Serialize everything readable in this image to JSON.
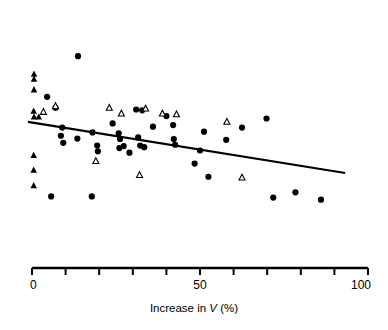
{
  "figure": {
    "title": "",
    "axis_label": "Increase in V (%)",
    "axis_label_parts": {
      "prefix": "Increase in ",
      "variable": "V",
      "suffix": " (%)"
    }
  },
  "chart_data": {
    "type": "scatter",
    "title": "",
    "xlabel": "Increase in V (%)",
    "ylabel": "",
    "xlim": [
      0,
      100
    ],
    "ylim": [
      0,
      100
    ],
    "grid": false,
    "legend": "none",
    "x_ticks": [
      0,
      10,
      20,
      30,
      40,
      50,
      60,
      70,
      80,
      90,
      100
    ],
    "x_tick_labels": [
      "0",
      "",
      "",
      "",
      "",
      "50",
      "",
      "",
      "",
      "",
      "100"
    ],
    "x_axis_labeled_ticks": [
      "0",
      "50",
      "100"
    ],
    "y_axis_visible": false,
    "regression_line": {
      "label": "fitted regression line",
      "x_start": -1.2,
      "x_end": 93.2,
      "y_start": 55.0,
      "y_end": 23.8,
      "color": "#000000",
      "width": 2.2
    },
    "series": [
      {
        "name": "filled-circle",
        "marker": "circle-filled",
        "color": "#000000",
        "size": 6.2,
        "points": [
          [
            13.7,
            95.0
          ],
          [
            4.5,
            70.2
          ],
          [
            7.0,
            63.5
          ],
          [
            9.0,
            51.5
          ],
          [
            8.6,
            46.5
          ],
          [
            9.3,
            42.2
          ],
          [
            5.7,
            9.5
          ],
          [
            13.5,
            44.8
          ],
          [
            18.0,
            48.5
          ],
          [
            17.8,
            9.5
          ],
          [
            19.4,
            40.5
          ],
          [
            19.6,
            37.0
          ],
          [
            24.0,
            54.0
          ],
          [
            25.8,
            48.0
          ],
          [
            26.2,
            44.5
          ],
          [
            26.0,
            39.0
          ],
          [
            27.3,
            40.2
          ],
          [
            29.0,
            36.2
          ],
          [
            31.0,
            62.5
          ],
          [
            32.8,
            62.0
          ],
          [
            31.6,
            45.5
          ],
          [
            32.2,
            40.5
          ],
          [
            33.4,
            39.5
          ],
          [
            36.0,
            52.0
          ],
          [
            40.0,
            58.5
          ],
          [
            42.0,
            53.0
          ],
          [
            42.2,
            44.5
          ],
          [
            42.6,
            41.0
          ],
          [
            48.4,
            29.5
          ],
          [
            50.0,
            37.5
          ],
          [
            51.2,
            49.0
          ],
          [
            52.5,
            21.5
          ],
          [
            57.8,
            44.0
          ],
          [
            62.5,
            51.5
          ],
          [
            69.8,
            57.0
          ],
          [
            71.8,
            8.8
          ],
          [
            78.4,
            12.0
          ],
          [
            86.0,
            7.5
          ]
        ]
      },
      {
        "name": "filled-triangle",
        "marker": "triangle-filled",
        "color": "#000000",
        "size": 6.5,
        "points": [
          [
            0.6,
            84.0
          ],
          [
            0.6,
            81.0
          ],
          [
            0.6,
            74.5
          ],
          [
            0.5,
            61.5
          ],
          [
            0.6,
            58.0
          ],
          [
            2.0,
            58.0
          ],
          [
            0.5,
            34.5
          ],
          [
            0.5,
            25.5
          ],
          [
            0.5,
            16.0
          ]
        ]
      },
      {
        "name": "open-triangle",
        "marker": "triangle-open",
        "color": "#000000",
        "size": 6.0,
        "points": [
          [
            3.4,
            61.0
          ],
          [
            7.0,
            64.5
          ],
          [
            23.0,
            63.5
          ],
          [
            26.6,
            60.0
          ],
          [
            33.8,
            63.0
          ],
          [
            38.8,
            60.0
          ],
          [
            43.0,
            59.5
          ],
          [
            19.0,
            31.0
          ],
          [
            32.0,
            22.5
          ],
          [
            58.0,
            55.0
          ],
          [
            62.5,
            21.0
          ]
        ]
      }
    ]
  }
}
